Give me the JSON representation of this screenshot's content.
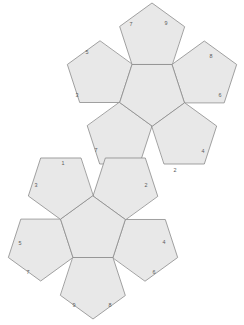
{
  "figure": {
    "type": "polyhedron-net",
    "shape": "regular dodecahedron",
    "face_count": 12,
    "face_sides": 5,
    "background_color": "#ffffff",
    "face_fill_color": "#e8e8e8",
    "face_stroke_color": "#8a8a8a",
    "label_color": "#5a5a5a",
    "stroke_width": 0.8,
    "canvas": {
      "width": 244,
      "height": 325
    }
  },
  "clusters": [
    {
      "id": "upper-cluster",
      "center": {
        "x": 152,
        "y": 92
      },
      "circumradius": 34,
      "orientation_deg": 180,
      "center_face": {
        "id": "upper-center-face",
        "label": ""
      },
      "petals": [
        {
          "id": "upper-petal-top",
          "position": "top",
          "labels": [
            "7",
            "9"
          ]
        },
        {
          "id": "upper-petal-upper-left",
          "position": "upper-left",
          "labels": [
            "5",
            "3"
          ]
        },
        {
          "id": "upper-petal-upper-right",
          "position": "upper-right",
          "labels": [
            "8",
            "6"
          ]
        },
        {
          "id": "upper-petal-lower-right",
          "position": "lower-right",
          "labels": [
            "4",
            "2"
          ]
        },
        {
          "id": "upper-petal-lower-left",
          "position": "lower-left",
          "labels": [
            "7",
            "2"
          ]
        }
      ]
    },
    {
      "id": "lower-cluster",
      "center": {
        "x": 93,
        "y": 230
      },
      "circumradius": 34,
      "orientation_deg": 0,
      "center_face": {
        "id": "lower-center-face",
        "label": ""
      },
      "petals": [
        {
          "id": "lower-petal-upper-left",
          "position": "upper-left",
          "labels": [
            "1",
            "3"
          ]
        },
        {
          "id": "lower-petal-upper-right",
          "position": "upper-right",
          "labels": [
            "2",
            ""
          ]
        },
        {
          "id": "lower-petal-left",
          "position": "left",
          "labels": [
            "5",
            "7"
          ]
        },
        {
          "id": "lower-petal-right",
          "position": "right",
          "labels": [
            "4",
            "6"
          ]
        },
        {
          "id": "lower-petal-bottom",
          "position": "bottom",
          "labels": [
            "9",
            "8"
          ]
        }
      ]
    }
  ],
  "vertex_labels": [
    {
      "id": "label-top-7",
      "text": "7",
      "x": 131,
      "y": 25
    },
    {
      "id": "label-top-9",
      "text": "9",
      "x": 166,
      "y": 24
    },
    {
      "id": "label-ul-5",
      "text": "5",
      "x": 87,
      "y": 53
    },
    {
      "id": "label-ul-3",
      "text": "3",
      "x": 77,
      "y": 96
    },
    {
      "id": "label-ur-8",
      "text": "8",
      "x": 211,
      "y": 57
    },
    {
      "id": "label-ur-6",
      "text": "6",
      "x": 220,
      "y": 96
    },
    {
      "id": "label-lr-4",
      "text": "4",
      "x": 203,
      "y": 152
    },
    {
      "id": "label-lr-2",
      "text": "2",
      "x": 175,
      "y": 171
    },
    {
      "id": "label-ll-7",
      "text": "7",
      "x": 96,
      "y": 151
    },
    {
      "id": "label-ll-2",
      "text": "2",
      "x": 146,
      "y": 186
    },
    {
      "id": "label-lc-1",
      "text": "1",
      "x": 63,
      "y": 164
    },
    {
      "id": "label-lc-3",
      "text": "3",
      "x": 36,
      "y": 186
    },
    {
      "id": "label-lc-5",
      "text": "5",
      "x": 20,
      "y": 244
    },
    {
      "id": "label-lc-7",
      "text": "7",
      "x": 28,
      "y": 273
    },
    {
      "id": "label-lc-4",
      "text": "4",
      "x": 164,
      "y": 243
    },
    {
      "id": "label-lc-6",
      "text": "6",
      "x": 154,
      "y": 273
    },
    {
      "id": "label-lc-9",
      "text": "9",
      "x": 74,
      "y": 306
    },
    {
      "id": "label-lc-8",
      "text": "8",
      "x": 110,
      "y": 306
    }
  ]
}
